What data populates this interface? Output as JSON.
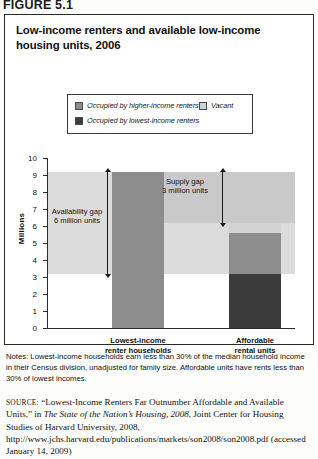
{
  "figure": {
    "number": "FIGURE 5.1",
    "title": "Low-income renters and available low-income housing units, 2006"
  },
  "legend": {
    "items": [
      {
        "label": "Occupied by higher-income renters",
        "color": "#8d8d8d",
        "swatch": "higher-income-swatch"
      },
      {
        "label": "Occupied by lowest-income renters",
        "color": "#3b3b3b",
        "swatch": "lowest-income-swatch"
      },
      {
        "label": "Vacant",
        "color": "#d2d2d2",
        "swatch": "vacant-swatch"
      }
    ]
  },
  "chart_data": {
    "type": "bar",
    "title": "Low-income renters and available low-income housing units, 2006",
    "xlabel": "",
    "ylabel": "Millions",
    "ylim": [
      0,
      10
    ],
    "yticks": [
      0,
      1,
      2,
      3,
      4,
      5,
      6,
      7,
      8,
      9,
      10
    ],
    "ytick_labels": [
      "0",
      "1",
      "2",
      "3",
      "4",
      "5",
      "6",
      "7",
      "8",
      "9",
      "10"
    ],
    "grid": false,
    "legend_position": "top-center",
    "stacked": true,
    "categories": [
      "Lowest-income renter households",
      "Affordable rental units"
    ],
    "series": [
      {
        "name": "Occupied by lowest-income renters",
        "color": "#3b3b3b",
        "values": [
          9.2,
          3.2
        ]
      },
      {
        "name": "Occupied by higher-income renters",
        "color": "#8d8d8d",
        "values": [
          0,
          2.4
        ]
      },
      {
        "name": "Vacant",
        "color": "#d2d2d2",
        "values": [
          0,
          0.6
        ]
      }
    ],
    "bar_totals": [
      9.2,
      6.2
    ],
    "notes_on_bar1": "Rendered as a single medium-gray bar reaching 9.2 million",
    "annotations": [
      {
        "name": "availability-gap",
        "label_line1": "Availability gap",
        "label_line2": "6 million units",
        "from": 3.2,
        "to": 9.2,
        "value": 6
      },
      {
        "name": "supply-gap",
        "label_line1": "Supply gap",
        "label_line2": "3 million units",
        "from": 6.2,
        "to": 9.2,
        "value": 3
      }
    ],
    "bands": [
      {
        "name": "availability-band",
        "from": 3.2,
        "to": 9.2,
        "color": "#dcdcdc"
      },
      {
        "name": "supply-band",
        "from": 6.2,
        "to": 9.2,
        "color": "#c9c9c9"
      }
    ]
  },
  "axis": {
    "y_title": "Millions",
    "ticks": [
      "10",
      "9",
      "8",
      "7",
      "6",
      "5",
      "4",
      "3",
      "2",
      "1",
      "0"
    ]
  },
  "categories": [
    {
      "line1": "Lowest-income",
      "line2": "renter households"
    },
    {
      "line1": "Affordable",
      "line2": "rental units"
    }
  ],
  "notes": {
    "text": "Notes: Lowest-income households earn less than 30% of the median household income in their Census division, unadjusted for family size. Affordable units have rents less than 30% of lowest incomes."
  },
  "source": {
    "keyword": "SOURCE:",
    "part1": " “Lowest-Income Renters Far Outnumber Affordable and Available Units,” in ",
    "italic": "The State of the Nation’s Housing, 2008",
    "part2": ", Joint Center for Housing Studies of Harvard University, 2008, http://www.jchs.harvard.edu/publications/markets/son2008/son2008.pdf (accessed January 14, 2009)"
  }
}
